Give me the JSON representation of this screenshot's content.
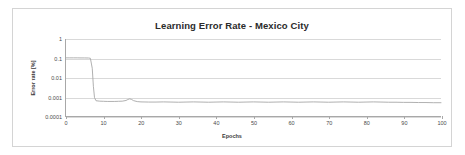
{
  "chart_data": {
    "type": "line",
    "title": "Learning Error Rate - Mexico City",
    "xlabel": "Epochs",
    "ylabel": "Error rate [%]",
    "xlim": [
      0,
      100
    ],
    "ylim": [
      0.0001,
      1
    ],
    "yscale": "log",
    "grid": true,
    "legend": false,
    "line_color": "#a6a6a6",
    "xticks": [
      0,
      10,
      20,
      30,
      40,
      50,
      60,
      70,
      80,
      90,
      100
    ],
    "xtick_labels": [
      "0",
      "10",
      "20",
      "30",
      "40",
      "50",
      "60",
      "70",
      "80",
      "90",
      "100"
    ],
    "yticks": [
      1,
      0.1,
      0.01,
      0.001,
      0.0001
    ],
    "ytick_labels": [
      "1",
      "0.1",
      "0.01",
      "0.001",
      "0.0001"
    ],
    "series": [
      {
        "name": "Error rate",
        "x": [
          0,
          1,
          2,
          3,
          4,
          5,
          6,
          6.5,
          7,
          7.3,
          7.6,
          8,
          9,
          10,
          11,
          12,
          13,
          14,
          15,
          16,
          16.5,
          17,
          17.5,
          18,
          19,
          20,
          22,
          24,
          26,
          28,
          30,
          32,
          34,
          36,
          38,
          40,
          42,
          44,
          46,
          48,
          50,
          52,
          54,
          56,
          58,
          60,
          62,
          64,
          66,
          68,
          70,
          72,
          74,
          76,
          78,
          80,
          82,
          84,
          86,
          88,
          90,
          92,
          94,
          96,
          98,
          100
        ],
        "y": [
          0.105,
          0.105,
          0.105,
          0.105,
          0.104,
          0.104,
          0.103,
          0.1,
          0.03,
          0.0035,
          0.0009,
          0.00062,
          0.00059,
          0.00058,
          0.00057,
          0.00057,
          0.00057,
          0.00058,
          0.00059,
          0.00064,
          0.00072,
          0.00078,
          0.00072,
          0.00063,
          0.00056,
          0.00054,
          0.00053,
          0.00053,
          0.00054,
          0.00053,
          0.00052,
          0.00053,
          0.00054,
          0.00053,
          0.00052,
          0.00053,
          0.00054,
          0.00053,
          0.00052,
          0.00053,
          0.00054,
          0.00053,
          0.00052,
          0.00053,
          0.00054,
          0.00053,
          0.00052,
          0.00053,
          0.00054,
          0.00053,
          0.00052,
          0.00053,
          0.00054,
          0.00053,
          0.00052,
          0.00053,
          0.00054,
          0.00053,
          0.00052,
          0.00052,
          0.00051,
          0.00051,
          0.0005,
          0.0005,
          0.00049,
          0.00049
        ]
      }
    ]
  }
}
